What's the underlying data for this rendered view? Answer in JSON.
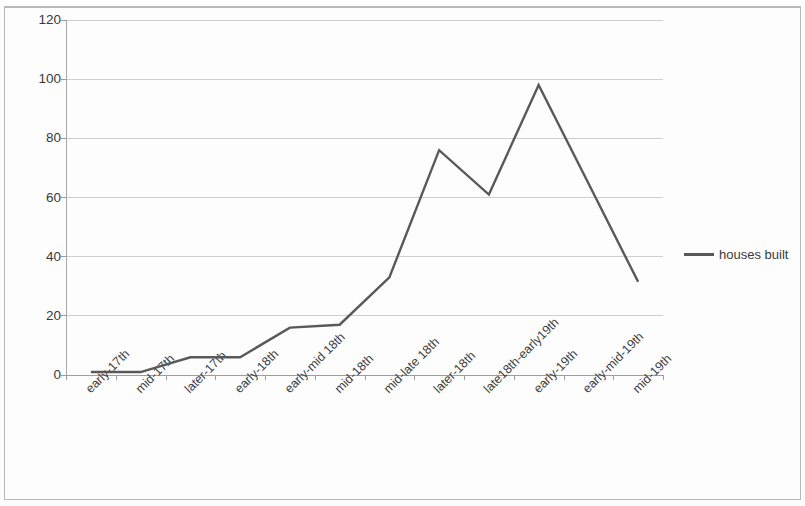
{
  "chart_data": {
    "type": "line",
    "title": "",
    "xlabel": "",
    "ylabel": "",
    "ylim": [
      0,
      120
    ],
    "ytick_values": [
      120,
      100,
      80,
      60,
      40,
      20,
      0
    ],
    "ytick_labels": [
      "120",
      "100",
      "80",
      "60",
      "40",
      "20",
      "0"
    ],
    "grid": "horizontal",
    "legend_position": "right",
    "categories": [
      "early-17th",
      "mid-17th",
      "later-17th",
      "early-18th",
      "early-mid 18th",
      "mid-18th",
      "mid-late 18th",
      "later-18th",
      "late18th-early19th",
      "early-19th",
      "early-mid-19th",
      "mid-19th"
    ],
    "series": [
      {
        "name": "houses built",
        "color": "#595959",
        "values": [
          1,
          1,
          6,
          6,
          16,
          17,
          33,
          76,
          61,
          98,
          64.8,
          31.5
        ]
      }
    ]
  },
  "legend": {
    "entries": [
      {
        "label": "houses built",
        "color": "#595959"
      }
    ]
  }
}
